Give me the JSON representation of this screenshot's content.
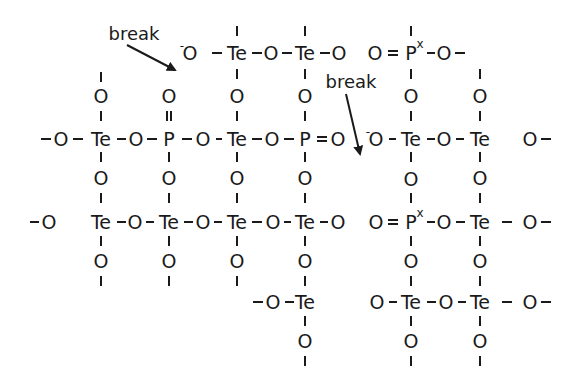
{
  "diagram": {
    "type": "chemical-network-structure",
    "labels": {
      "break_1": "break",
      "break_2": "break"
    },
    "elements": {
      "Te": "Te",
      "O": "O",
      "O_minus": "O",
      "minus_sup": "-",
      "P": "P",
      "Px_sup": "x"
    },
    "atoms": [
      {
        "id": "r0-o1",
        "sym": "O",
        "x": 190,
        "y": 53,
        "charge": "-"
      },
      {
        "id": "r0-te1",
        "sym": "Te",
        "x": 237,
        "y": 53
      },
      {
        "id": "r0-o2",
        "sym": "O",
        "x": 271,
        "y": 53
      },
      {
        "id": "r0-te2",
        "sym": "Te",
        "x": 305,
        "y": 53
      },
      {
        "id": "r0-o3",
        "sym": "O",
        "x": 339,
        "y": 53
      },
      {
        "id": "r0-o4",
        "sym": "O",
        "x": 375,
        "y": 53
      },
      {
        "id": "r0-p",
        "sym": "P",
        "x": 411,
        "y": 53,
        "sup": "x"
      },
      {
        "id": "r0-o5",
        "sym": "O",
        "x": 444,
        "y": 53
      },
      {
        "id": "r1-o1",
        "sym": "O",
        "x": 101,
        "y": 96
      },
      {
        "id": "r1-o2",
        "sym": "O",
        "x": 169,
        "y": 96
      },
      {
        "id": "r1-o3",
        "sym": "O",
        "x": 237,
        "y": 96
      },
      {
        "id": "r1-o4",
        "sym": "O",
        "x": 305,
        "y": 96
      },
      {
        "id": "r1-o5",
        "sym": "O",
        "x": 411,
        "y": 96
      },
      {
        "id": "r1-o6",
        "sym": "O",
        "x": 480,
        "y": 96
      },
      {
        "id": "r2-o1",
        "sym": "O",
        "x": 61,
        "y": 139
      },
      {
        "id": "r2-te1",
        "sym": "Te",
        "x": 101,
        "y": 139
      },
      {
        "id": "r2-o2",
        "sym": "O",
        "x": 136,
        "y": 139
      },
      {
        "id": "r2-p1",
        "sym": "P",
        "x": 169,
        "y": 139
      },
      {
        "id": "r2-o3",
        "sym": "O",
        "x": 203,
        "y": 139
      },
      {
        "id": "r2-te2",
        "sym": "Te",
        "x": 237,
        "y": 139
      },
      {
        "id": "r2-o4",
        "sym": "O",
        "x": 272,
        "y": 139
      },
      {
        "id": "r2-p2",
        "sym": "P",
        "x": 305,
        "y": 139
      },
      {
        "id": "r2-o5",
        "sym": "O",
        "x": 338,
        "y": 139
      },
      {
        "id": "r2-o6",
        "sym": "O",
        "x": 376,
        "y": 139,
        "charge": "-"
      },
      {
        "id": "r2-te3",
        "sym": "Te",
        "x": 411,
        "y": 139
      },
      {
        "id": "r2-o7",
        "sym": "O",
        "x": 444,
        "y": 139
      },
      {
        "id": "r2-te4",
        "sym": "Te",
        "x": 480,
        "y": 139
      },
      {
        "id": "r2-o8",
        "sym": "O",
        "x": 530,
        "y": 139
      },
      {
        "id": "r3-o1",
        "sym": "O",
        "x": 101,
        "y": 178
      },
      {
        "id": "r3-o2",
        "sym": "O",
        "x": 169,
        "y": 178
      },
      {
        "id": "r3-o3",
        "sym": "O",
        "x": 237,
        "y": 178
      },
      {
        "id": "r3-o4",
        "sym": "O",
        "x": 305,
        "y": 178
      },
      {
        "id": "r3-o5",
        "sym": "O",
        "x": 411,
        "y": 179
      },
      {
        "id": "r3-o6",
        "sym": "O",
        "x": 480,
        "y": 178
      },
      {
        "id": "r4-o1",
        "sym": "O",
        "x": 49,
        "y": 222
      },
      {
        "id": "r4-te1",
        "sym": "Te",
        "x": 101,
        "y": 222
      },
      {
        "id": "r4-o2",
        "sym": "O",
        "x": 135,
        "y": 222
      },
      {
        "id": "r4-te2",
        "sym": "Te",
        "x": 169,
        "y": 222
      },
      {
        "id": "r4-o3",
        "sym": "O",
        "x": 203,
        "y": 222
      },
      {
        "id": "r4-te3",
        "sym": "Te",
        "x": 237,
        "y": 222
      },
      {
        "id": "r4-o4",
        "sym": "O",
        "x": 273,
        "y": 222
      },
      {
        "id": "r4-te4",
        "sym": "Te",
        "x": 305,
        "y": 222
      },
      {
        "id": "r4-o5",
        "sym": "O",
        "x": 338,
        "y": 222
      },
      {
        "id": "r4-o6",
        "sym": "O",
        "x": 376,
        "y": 222
      },
      {
        "id": "r4-p",
        "sym": "P",
        "x": 411,
        "y": 222,
        "sup": "x"
      },
      {
        "id": "r4-o7",
        "sym": "O",
        "x": 444,
        "y": 222
      },
      {
        "id": "r4-te5",
        "sym": "Te",
        "x": 480,
        "y": 222
      },
      {
        "id": "r4-o8",
        "sym": "O",
        "x": 530,
        "y": 222
      },
      {
        "id": "r5-o1",
        "sym": "O",
        "x": 101,
        "y": 261
      },
      {
        "id": "r5-o2",
        "sym": "O",
        "x": 169,
        "y": 261
      },
      {
        "id": "r5-o3",
        "sym": "O",
        "x": 237,
        "y": 261
      },
      {
        "id": "r5-o4",
        "sym": "O",
        "x": 305,
        "y": 261
      },
      {
        "id": "r5-o5",
        "sym": "O",
        "x": 411,
        "y": 261
      },
      {
        "id": "r5-o6",
        "sym": "O",
        "x": 480,
        "y": 261
      },
      {
        "id": "r6-o1",
        "sym": "O",
        "x": 273,
        "y": 302
      },
      {
        "id": "r6-te1",
        "sym": "Te",
        "x": 305,
        "y": 302
      },
      {
        "id": "r6-o2",
        "sym": "O",
        "x": 377,
        "y": 302
      },
      {
        "id": "r6-te2",
        "sym": "Te",
        "x": 411,
        "y": 302
      },
      {
        "id": "r6-o3",
        "sym": "O",
        "x": 446,
        "y": 302
      },
      {
        "id": "r6-te3",
        "sym": "Te",
        "x": 480,
        "y": 302
      },
      {
        "id": "r6-o4",
        "sym": "O",
        "x": 530,
        "y": 302
      },
      {
        "id": "r7-o1",
        "sym": "O",
        "x": 305,
        "y": 341
      },
      {
        "id": "r7-o2",
        "sym": "O",
        "x": 411,
        "y": 341
      },
      {
        "id": "r7-o3",
        "sym": "O",
        "x": 480,
        "y": 341
      }
    ]
  }
}
